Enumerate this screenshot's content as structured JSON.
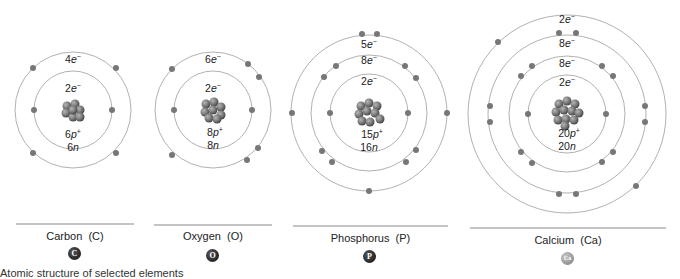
{
  "figure": {
    "caption_partial": "Atomic structure of selected elements"
  },
  "atoms": [
    {
      "name": "Carbon",
      "symbol": "C",
      "label": "Carbon  (C)",
      "protons": "6",
      "neutrons": "6",
      "shells": [
        "2",
        "4"
      ],
      "badge_color": "#1a1a1a"
    },
    {
      "name": "Oxygen",
      "symbol": "O",
      "label": "Oxygen  (O)",
      "protons": "8",
      "neutrons": "8",
      "shells": [
        "2",
        "6"
      ],
      "badge_color": "#1a1a1a"
    },
    {
      "name": "Phosphorus",
      "symbol": "P",
      "label": "Phosphorus  (P)",
      "protons": "15",
      "neutrons": "16",
      "shells": [
        "2",
        "8",
        "5"
      ],
      "badge_color": "#1a1a1a"
    },
    {
      "name": "Calcium",
      "symbol": "Ca",
      "label": "Calcium  (Ca)",
      "protons": "20",
      "neutrons": "20",
      "shells": [
        "2",
        "8",
        "8",
        "2"
      ],
      "badge_color": "#8a8a8a"
    }
  ],
  "labels": {
    "electron_suffix": "e⁻",
    "proton_suffix": "p⁺",
    "neutron_suffix": "n"
  }
}
